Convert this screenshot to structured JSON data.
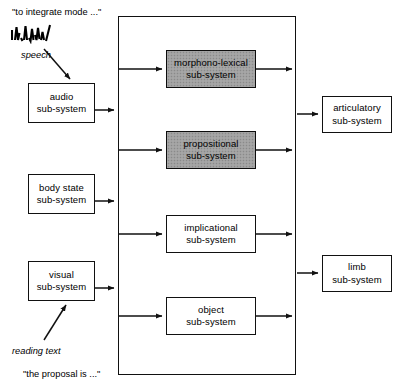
{
  "diagram": {
    "title_text": "Interacting Cognitive Subsystems architecture",
    "colors": {
      "line": "#111111",
      "box_fill": "#ffffff",
      "shaded_fill": "#a0a0a0",
      "text": "#000000"
    },
    "annotations": {
      "speech_quote": "\"to integrate mode ...\"",
      "speech_label": "speech",
      "reading_label": "reading text",
      "reading_quote": "\"the proposal is ...\"",
      "waveform_icon": "speech-waveform-icon"
    },
    "input_boxes": [
      {
        "id": "audio",
        "line1": "audio",
        "line2": "sub-system"
      },
      {
        "id": "body-state",
        "line1": "body state",
        "line2": "sub-system"
      },
      {
        "id": "visual",
        "line1": "visual",
        "line2": "sub-system"
      }
    ],
    "central_boxes": [
      {
        "id": "morphono-lexical",
        "line1": "morphono-lexical",
        "line2": "sub-system",
        "shaded": true
      },
      {
        "id": "propositional",
        "line1": "propositional",
        "line2": "sub-system",
        "shaded": true
      },
      {
        "id": "implicational",
        "line1": "implicational",
        "line2": "sub-system",
        "shaded": false
      },
      {
        "id": "object",
        "line1": "object",
        "line2": "sub-system",
        "shaded": false
      }
    ],
    "output_boxes": [
      {
        "id": "articulatory",
        "line1": "articulatory",
        "line2": "sub-system"
      },
      {
        "id": "limb",
        "line1": "limb",
        "line2": "sub-system"
      }
    ]
  }
}
